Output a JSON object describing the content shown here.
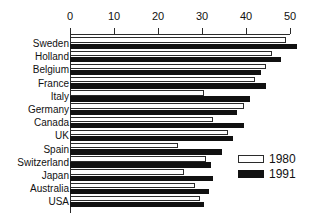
{
  "chart_data": {
    "type": "bar",
    "orientation": "horizontal",
    "title": "",
    "subtitle": "",
    "xlabel": "",
    "ylabel": "",
    "xlim": [
      0,
      50
    ],
    "xticks": [
      0,
      10,
      20,
      30,
      40,
      50
    ],
    "xtick_labels": [
      "0",
      "10",
      "20",
      "30",
      "40",
      "50"
    ],
    "grid": false,
    "legend_position": "center-right",
    "categories": [
      "Sweden",
      "Holland",
      "Belgium",
      "France",
      "Italy",
      "Germany",
      "Canada",
      "UK",
      "Spain",
      "Switzerland",
      "Japan",
      "Australia",
      "USA"
    ],
    "series": [
      {
        "name": "1980",
        "color": "#ffffff",
        "edge_color": "#2b2b2b",
        "values": [
          49.0,
          46.0,
          44.5,
          42.0,
          30.5,
          39.5,
          32.5,
          36.0,
          24.5,
          31.0,
          26.0,
          28.5,
          29.5
        ]
      },
      {
        "name": "1991",
        "color": "#111111",
        "edge_color": "#111111",
        "values": [
          51.5,
          48.0,
          43.5,
          44.5,
          41.0,
          38.0,
          39.5,
          37.0,
          34.5,
          32.0,
          32.5,
          31.5,
          30.5
        ]
      }
    ]
  },
  "legend": {
    "items": [
      {
        "label": "1980",
        "swatch": "hollow-white"
      },
      {
        "label": "1991",
        "swatch": "solid-black"
      }
    ]
  }
}
